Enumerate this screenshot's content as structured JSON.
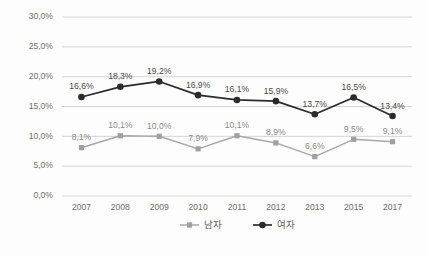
{
  "chart_data": {
    "type": "line",
    "title": "",
    "subtitle": "",
    "xlabel": "",
    "ylabel": "",
    "categories": [
      "2007",
      "2008",
      "2009",
      "2010",
      "2011",
      "2012",
      "2013",
      "2015",
      "2017"
    ],
    "ylim": [
      0,
      30
    ],
    "ytick_values": [
      0,
      5,
      10,
      15,
      20,
      25,
      30
    ],
    "ytick_labels": [
      "0,0%",
      "5,0%",
      "10,0%",
      "15,0%",
      "20,0%",
      "25,0%",
      "30,0%"
    ],
    "grid": "horizontal",
    "legend_position": "bottom-center",
    "series": [
      {
        "name": "남자",
        "marker": "square",
        "color": "#a0a0a0",
        "values": [
          8.1,
          10.1,
          10.0,
          7.9,
          10.1,
          8.9,
          6.6,
          9.5,
          9.1
        ],
        "labels": [
          "8,1%",
          "10,1%",
          "10,0%",
          "7,9%",
          "10,1%",
          "8,9%",
          "6,6%",
          "9,5%",
          "9,1%"
        ],
        "label_positions": [
          "above",
          "above",
          "above",
          "above",
          "above",
          "above",
          "above",
          "above",
          "above"
        ]
      },
      {
        "name": "여자",
        "marker": "circle",
        "color": "#2b2b2b",
        "values": [
          16.6,
          18.3,
          19.2,
          16.9,
          16.1,
          15.9,
          13.7,
          16.5,
          13.4
        ],
        "labels": [
          "16,6%",
          "18,3%",
          "19,2%",
          "16,9%",
          "16,1%",
          "15,9%",
          "13,7%",
          "16,5%",
          "13,4%"
        ],
        "label_positions": [
          "above",
          "above",
          "above",
          "above",
          "above",
          "above",
          "above",
          "above",
          "above"
        ]
      }
    ]
  },
  "legend": {
    "items": [
      {
        "label": "남자",
        "color": "#a0a0a0",
        "marker": "square"
      },
      {
        "label": "여자",
        "color": "#2b2b2b",
        "marker": "circle"
      }
    ]
  },
  "colors": {
    "grid": "#c9c9c9",
    "background": "#fdfdfd",
    "tick_text": "#6d6d6d",
    "female_series": "#2b2b2b",
    "male_series": "#a0a0a0"
  }
}
